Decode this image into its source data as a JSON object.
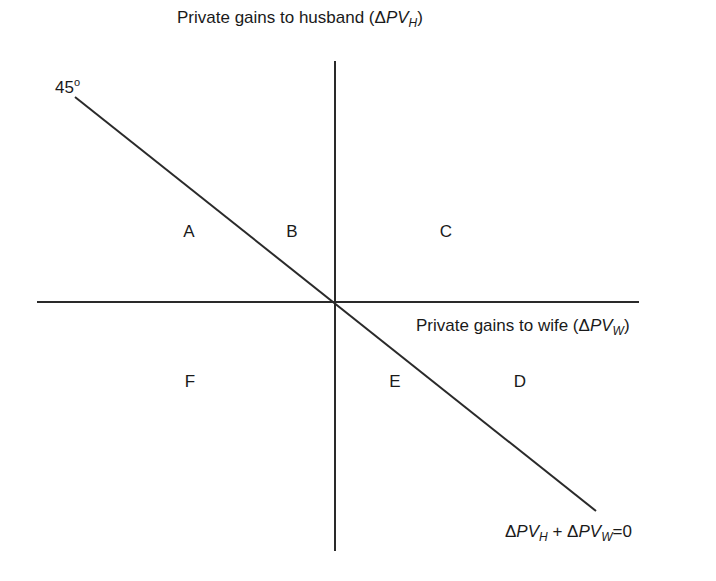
{
  "diagram": {
    "y_axis_label": {
      "text": "Private gains to husband (",
      "delta": "Δ",
      "var": "PV",
      "sub": "H",
      "close": ")"
    },
    "x_axis_label": {
      "text": "Private gains to wife (",
      "delta": "Δ",
      "var": "PV",
      "sub": "W",
      "close": ")"
    },
    "angle_label": "45",
    "angle_degree": "o",
    "line_label": {
      "d1": "Δ",
      "v1": "PV",
      "s1": "H",
      "plus": " + ",
      "d2": "Δ",
      "v2": "PV",
      "s2": "W",
      "eq": "=0"
    },
    "regions": [
      {
        "id": "A",
        "label": "A"
      },
      {
        "id": "B",
        "label": "B"
      },
      {
        "id": "C",
        "label": "C"
      },
      {
        "id": "D",
        "label": "D"
      },
      {
        "id": "E",
        "label": "E"
      },
      {
        "id": "F",
        "label": "F"
      }
    ],
    "colors": {
      "line": "#2a2a2a",
      "text": "#1a1a1a",
      "background": "#ffffff"
    }
  }
}
